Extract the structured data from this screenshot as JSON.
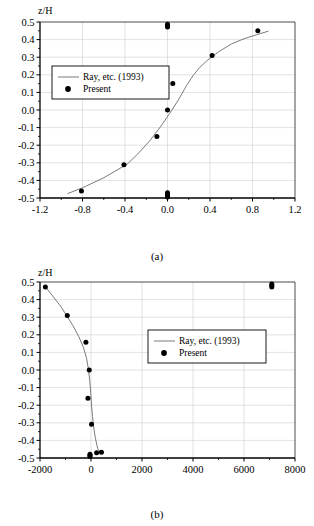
{
  "figure": {
    "panels": [
      {
        "id": "a",
        "caption": "(a)",
        "ylabel": "z/H"
      },
      {
        "id": "b",
        "caption": "(b)",
        "ylabel": "z/H"
      }
    ]
  },
  "chart_data": [
    {
      "type": "scatter",
      "panel": "a",
      "title": "",
      "xlabel": "",
      "ylabel": "z/H",
      "xlim": [
        -1.2,
        1.2
      ],
      "ylim": [
        -0.5,
        0.5
      ],
      "xticks": [
        -1.2,
        -0.8,
        -0.4,
        0.0,
        0.4,
        0.8,
        1.2
      ],
      "xticklabels": [
        "-1.2",
        "-0.8",
        "-0.4",
        "0.0",
        "0.4",
        "0.8",
        "1.2"
      ],
      "yticks": [
        -0.5,
        -0.4,
        -0.3,
        -0.2,
        -0.1,
        0.0,
        0.1,
        0.2,
        0.3,
        0.4,
        0.5
      ],
      "yticklabels": [
        "-0.5",
        "-0.4",
        "-0.3",
        "-0.2",
        "-0.1",
        "0.0",
        "0.1",
        "0.2",
        "0.3",
        "0.4",
        "0.5"
      ],
      "grid": true,
      "legend_position": "upper-left",
      "series": [
        {
          "name": "Ray, etc. (1993)",
          "style": "line",
          "x": [
            -0.94,
            -0.8,
            -0.6,
            -0.42,
            -0.38,
            -0.28,
            -0.16,
            -0.06,
            0.02,
            0.1,
            0.18,
            0.24,
            0.3,
            0.38,
            0.48,
            0.6,
            0.72,
            0.84,
            0.95
          ],
          "y": [
            -0.475,
            -0.442,
            -0.385,
            -0.322,
            -0.308,
            -0.25,
            -0.17,
            -0.09,
            -0.02,
            0.055,
            0.14,
            0.195,
            0.24,
            0.285,
            0.33,
            0.375,
            0.405,
            0.428,
            0.448
          ]
        },
        {
          "name": "Present",
          "style": "markers",
          "x": [
            -0.81,
            -0.41,
            -0.1,
            0.0,
            0.05,
            0.42,
            0.85,
            0.0,
            0.0,
            0.0,
            0.0,
            0.0,
            0.0,
            0.0,
            0.0
          ],
          "y": [
            -0.46,
            -0.311,
            -0.15,
            0.0,
            0.151,
            0.309,
            0.45,
            0.487,
            0.48,
            0.472,
            -0.47,
            -0.478,
            -0.484,
            -0.49,
            -0.494
          ]
        }
      ]
    },
    {
      "type": "scatter",
      "panel": "b",
      "title": "",
      "xlabel": "",
      "ylabel": "z/H",
      "xlim": [
        -2000,
        8000
      ],
      "ylim": [
        -0.5,
        0.5
      ],
      "xticks": [
        -2000,
        0,
        2000,
        4000,
        6000,
        8000
      ],
      "xticklabels": [
        "-2000",
        "0",
        "2000",
        "4000",
        "6000",
        "8000"
      ],
      "yticks": [
        -0.5,
        -0.4,
        -0.3,
        -0.2,
        -0.1,
        0.0,
        0.1,
        0.2,
        0.3,
        0.4,
        0.5
      ],
      "yticklabels": [
        "-0.5",
        "-0.4",
        "-0.3",
        "-0.2",
        "-0.1",
        "0.0",
        "0.1",
        "0.2",
        "0.3",
        "0.4",
        "0.5"
      ],
      "grid": true,
      "legend_position": "upper-right",
      "series": [
        {
          "name": "Ray, etc. (1993)",
          "style": "line",
          "x": [
            -1830,
            -1500,
            -1180,
            -950,
            -700,
            -480,
            -300,
            -180,
            -100,
            -50,
            -10,
            20,
            60,
            110,
            175,
            260,
            390
          ],
          "y": [
            0.48,
            0.42,
            0.36,
            0.308,
            0.25,
            0.19,
            0.13,
            0.07,
            0.005,
            -0.06,
            -0.13,
            -0.2,
            -0.265,
            -0.33,
            -0.39,
            -0.445,
            -0.48
          ]
        },
        {
          "name": "Present",
          "style": "markers",
          "x": [
            -1790,
            -930,
            -200,
            -70,
            -120,
            20,
            220,
            410,
            -40,
            -40,
            -40,
            7090,
            7090,
            7090
          ],
          "y": [
            0.472,
            0.31,
            0.158,
            0.0,
            -0.16,
            -0.308,
            -0.47,
            -0.468,
            -0.478,
            -0.486,
            -0.492,
            0.488,
            0.48,
            0.472
          ]
        }
      ]
    }
  ],
  "legend": {
    "entries": [
      {
        "label": "Ray, etc. (1993)",
        "marker": "line"
      },
      {
        "label": "Present",
        "marker": "filled-circle"
      }
    ]
  },
  "colors": {
    "line": "#6b6b6b",
    "marker": "#000000",
    "axis": "#000000",
    "grid": "#cfcfcf",
    "background": "#ffffff"
  }
}
